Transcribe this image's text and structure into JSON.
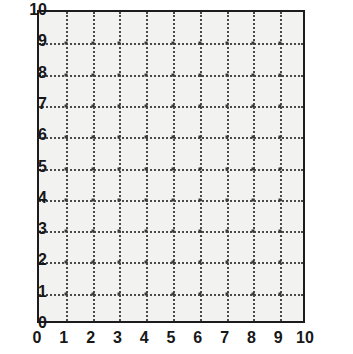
{
  "chart_data": {
    "type": "scatter",
    "title": "",
    "subtitle": "",
    "xlabel": "",
    "ylabel": "",
    "xlim": [
      0,
      10
    ],
    "ylim": [
      0,
      10
    ],
    "xticks": [
      0,
      1,
      2,
      3,
      4,
      5,
      6,
      7,
      8,
      9,
      10
    ],
    "yticks": [
      0,
      1,
      2,
      3,
      4,
      5,
      6,
      7,
      8,
      9,
      10
    ],
    "xtick_labels": [
      "0",
      "1",
      "2",
      "3",
      "4",
      "5",
      "6",
      "7",
      "8",
      "9",
      "10"
    ],
    "ytick_labels": [
      "0",
      "1",
      "2",
      "3",
      "4",
      "5",
      "6",
      "7",
      "8",
      "9",
      "10"
    ],
    "grid": true,
    "grid_style": "dotted",
    "legend": null,
    "legend_position": "none",
    "annotations": [],
    "series": [],
    "values": [],
    "x": []
  },
  "figure": {
    "background_color": "#ffffff",
    "plot_background_color": "#f2f2f0",
    "axis_color": "#1c1c1c",
    "grid_color": "#4a4a4a",
    "label_color": "#171717"
  }
}
